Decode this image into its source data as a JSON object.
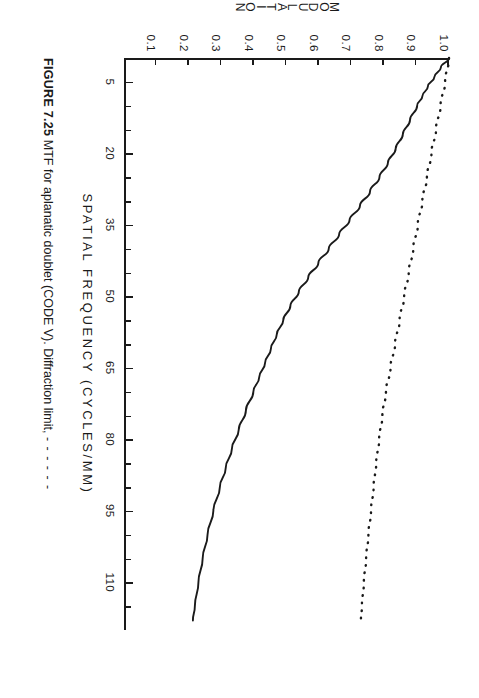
{
  "figure": {
    "caption_label": "FIGURE 7.25",
    "caption_text": "MTF for aplanatic doublet (CODE V). Diffraction limit,",
    "caption_dashes": "- - - - - -"
  },
  "chart_data": {
    "type": "line",
    "title": "",
    "xlabel": "SPATIAL  FREQUENCY  (CYCLES/MM)",
    "ylabel": "MODULATION",
    "xlim": [
      0,
      120
    ],
    "ylim": [
      0,
      1.0
    ],
    "grid": false,
    "legend_position": "none",
    "x_ticks_major": [
      5,
      20,
      35,
      50,
      65,
      80,
      95,
      110
    ],
    "x_tick_labels": [
      "5",
      "20",
      "35",
      "50",
      "65",
      "80",
      "95",
      "110"
    ],
    "x_ticks_minor": [
      10,
      15,
      25,
      30,
      40,
      45,
      55,
      60,
      70,
      75,
      85,
      90,
      100,
      105,
      115
    ],
    "y_ticks": [
      1.0,
      0.9,
      0.8,
      0.7,
      0.6,
      0.5,
      0.4,
      0.3,
      0.2,
      0.1
    ],
    "y_tick_labels": [
      "1.0",
      "0.9",
      "0.8",
      "0.7",
      "0.6",
      "0.5",
      "0.4",
      "0.3",
      "0.2",
      "0.1"
    ],
    "series": [
      {
        "name": "Aplanatic doublet MTF",
        "style": "solid",
        "x": [
          0,
          2,
          4,
          6,
          8,
          10,
          13,
          16,
          19,
          22,
          25,
          28,
          31,
          34,
          37,
          40,
          43,
          46,
          49,
          52,
          55,
          58,
          61,
          64,
          67,
          70,
          74,
          78,
          82,
          86,
          90,
          95,
          100,
          105,
          110,
          115,
          118
        ],
        "y": [
          1.0,
          0.975,
          0.955,
          0.935,
          0.918,
          0.902,
          0.88,
          0.858,
          0.836,
          0.812,
          0.786,
          0.757,
          0.726,
          0.694,
          0.662,
          0.63,
          0.598,
          0.567,
          0.538,
          0.512,
          0.49,
          0.47,
          0.452,
          0.434,
          0.416,
          0.398,
          0.375,
          0.353,
          0.332,
          0.313,
          0.295,
          0.275,
          0.257,
          0.242,
          0.229,
          0.218,
          0.212
        ]
      },
      {
        "name": "Diffraction limit",
        "style": "dotted",
        "x": [
          0,
          5,
          10,
          15,
          20,
          25,
          30,
          35,
          40,
          45,
          50,
          55,
          60,
          65,
          70,
          75,
          80,
          85,
          90,
          95,
          100,
          105,
          110,
          115,
          118
        ],
        "y": [
          1.0,
          0.988,
          0.974,
          0.96,
          0.946,
          0.932,
          0.918,
          0.904,
          0.89,
          0.876,
          0.862,
          0.848,
          0.834,
          0.82,
          0.806,
          0.795,
          0.785,
          0.776,
          0.768,
          0.76,
          0.752,
          0.745,
          0.738,
          0.732,
          0.729
        ]
      }
    ]
  },
  "colors": {
    "ink": "#1a1a1a",
    "background": "#ffffff"
  }
}
